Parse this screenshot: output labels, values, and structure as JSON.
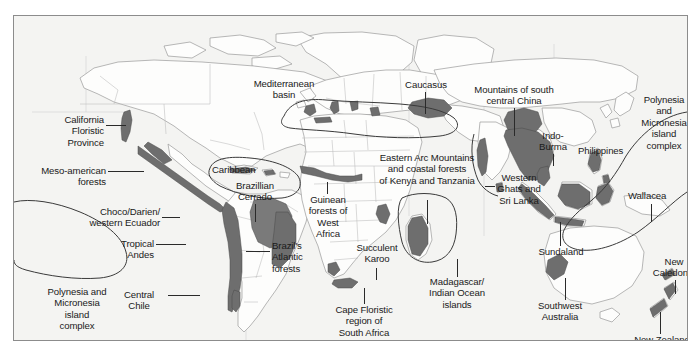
{
  "figure": {
    "type": "map",
    "frame": {
      "x": 13,
      "y": 15,
      "width": 675,
      "height": 326
    },
    "colors": {
      "background": "#ffffff",
      "map_background": "#f4f4f2",
      "frame_border": "#8c8c8c",
      "coastline": "#9a9a9a",
      "country_border": "#b4b4b4",
      "hotspot_fill": "#6e6e6e",
      "hotspot_outline": "#3a3a3a",
      "text": "#1a1a1a",
      "leader_line": "#2a2a2a"
    }
  },
  "labels": [
    {
      "id": "california-floristic-province",
      "text": "California\nFloristic\nProvince",
      "align": "right",
      "x": 18,
      "y": 98,
      "width": 72
    },
    {
      "id": "meso-american-forests",
      "text": "Meso-american\nforests",
      "align": "right",
      "x": 10,
      "y": 149,
      "width": 82
    },
    {
      "id": "choco-darien-western-ecuador",
      "text": "Choco/Darien/\nwestern Ecuador",
      "align": "right",
      "x": 58,
      "y": 190,
      "width": 88
    },
    {
      "id": "tropical-andes",
      "text": "Tropical\nAndes",
      "align": "right",
      "x": 78,
      "y": 222,
      "width": 62
    },
    {
      "id": "polynesia-micronesia-left",
      "text": "Polynesia and\nMicronesia\nisland\ncomplex",
      "align": "center",
      "x": 22,
      "y": 275,
      "width": 92
    },
    {
      "id": "central-chile",
      "text": "Central\nChile",
      "align": "center",
      "x": 98,
      "y": 273,
      "width": 54
    },
    {
      "id": "caribbean",
      "text": "Caribbean",
      "align": "left",
      "x": 198,
      "y": 148,
      "width": 62
    },
    {
      "id": "brazillian-cerrado",
      "text": "Brazillian\nCerrado",
      "align": "center",
      "x": 213,
      "y": 166,
      "width": 58
    },
    {
      "id": "brazils-atlantic-forests",
      "text": "Brazil's\nAtlantic\nforests",
      "align": "left",
      "x": 258,
      "y": 225,
      "width": 48
    },
    {
      "id": "mediterranean-basin",
      "text": "Mediterranean\nbasin",
      "align": "center",
      "x": 228,
      "y": 74,
      "width": 84
    },
    {
      "id": "caucasus",
      "text": "Caucasus",
      "align": "center",
      "x": 381,
      "y": 63,
      "width": 62
    },
    {
      "id": "mountains-south-central-china",
      "text": "Mountains of south\ncentral China",
      "align": "center",
      "x": 464,
      "y": 68,
      "width": 108
    },
    {
      "id": "indo-burma",
      "text": "Indo-\nBurma",
      "align": "center",
      "x": 522,
      "y": 115,
      "width": 38
    },
    {
      "id": "philippines",
      "text": "Philippines",
      "align": "left",
      "x": 567,
      "y": 130,
      "width": 64
    },
    {
      "id": "polynesia-micronesia-right",
      "text": "Polynesia\nand\nMicronesia\nisland\ncomplex",
      "align": "center",
      "x": 628,
      "y": 95,
      "width": 66
    },
    {
      "id": "eastern-arc-mountains",
      "text": "Eastern Arc Mountains\nand coastal forests\nof Kenya and Tanzania",
      "align": "center",
      "x": 348,
      "y": 148,
      "width": 132
    },
    {
      "id": "guinean-forests-west-africa",
      "text": "Guinean\nforests of\nWest\nAfrica",
      "align": "center",
      "x": 283,
      "y": 182,
      "width": 62
    },
    {
      "id": "succulent-karoo",
      "text": "Succulent\nKaroo",
      "align": "center",
      "x": 340,
      "y": 229,
      "width": 58
    },
    {
      "id": "cape-floristic-region",
      "text": "Cape Floristic\nregion of\nSouth Africa",
      "align": "center",
      "x": 308,
      "y": 295,
      "width": 84
    },
    {
      "id": "madagascar-indian-ocean",
      "text": "Madagascar/\nIndian Ocean\nislands",
      "align": "center",
      "x": 405,
      "y": 262,
      "width": 78
    },
    {
      "id": "western-ghats-sri-lanka",
      "text": "Western\nGhats and\nSri Lanka",
      "align": "center",
      "x": 479,
      "y": 157,
      "width": 58
    },
    {
      "id": "wallacea",
      "text": "Wallacea",
      "align": "left",
      "x": 621,
      "y": 190,
      "width": 58
    },
    {
      "id": "sundaland",
      "text": "Sundaland",
      "align": "center",
      "x": 521,
      "y": 230,
      "width": 62
    },
    {
      "id": "southwest-australia",
      "text": "Southwest\nAustralia",
      "align": "center",
      "x": 513,
      "y": 302,
      "width": 66
    },
    {
      "id": "new-caledonia",
      "text": "New\nCaledonia",
      "align": "center",
      "x": 637,
      "y": 251,
      "width": 58
    },
    {
      "id": "new-zealand",
      "text": "New Zealand",
      "align": "center",
      "x": 615,
      "y": 320,
      "width": 74
    }
  ],
  "leaders": [
    {
      "id": "leader-california",
      "type": "h",
      "x": 92,
      "y": 109,
      "length": 20
    },
    {
      "id": "leader-mesoamerican",
      "type": "h",
      "x": 94,
      "y": 155,
      "length": 36
    },
    {
      "id": "leader-choco",
      "type": "h",
      "x": 148,
      "y": 201,
      "length": 18
    },
    {
      "id": "leader-andes",
      "type": "h",
      "x": 142,
      "y": 228,
      "length": 30
    },
    {
      "id": "leader-chile",
      "type": "h",
      "x": 154,
      "y": 279,
      "length": 32
    },
    {
      "id": "leader-cerrado",
      "type": "v",
      "x": 241,
      "y": 188,
      "length": 18
    },
    {
      "id": "leader-atlantic",
      "type": "h",
      "x": 232,
      "y": 235,
      "length": 24
    },
    {
      "id": "leader-caucasus",
      "type": "v",
      "x": 411,
      "y": 76,
      "length": 22
    },
    {
      "id": "leader-china",
      "type": "v",
      "x": 500,
      "y": 92,
      "length": 28
    },
    {
      "id": "leader-indoburma",
      "type": "v",
      "x": 539,
      "y": 138,
      "length": 12
    },
    {
      "id": "leader-easternarc",
      "type": "v",
      "x": 413,
      "y": 184,
      "length": 24
    },
    {
      "id": "leader-guinean",
      "type": "v",
      "x": 313,
      "y": 173,
      "length": 10
    },
    {
      "id": "leader-karoo",
      "type": "v",
      "x": 362,
      "y": 254,
      "length": 12
    },
    {
      "id": "leader-cape",
      "type": "v",
      "x": 350,
      "y": 281,
      "length": 14
    },
    {
      "id": "leader-madagascar",
      "type": "v",
      "x": 443,
      "y": 243,
      "length": 18
    },
    {
      "id": "leader-ghats",
      "type": "h",
      "x": 471,
      "y": 170,
      "length": 10
    },
    {
      "id": "leader-wallacea",
      "type": "v",
      "x": 637,
      "y": 201,
      "length": 18
    },
    {
      "id": "leader-sundaland",
      "type": "v",
      "x": 546,
      "y": 206,
      "length": 24
    },
    {
      "id": "leader-southwest-aus",
      "type": "v",
      "x": 551,
      "y": 281,
      "length": 20
    },
    {
      "id": "leader-newcaledonia",
      "type": "v",
      "x": 661,
      "y": 273,
      "length": 14
    },
    {
      "id": "leader-newzealand",
      "type": "v",
      "x": 646,
      "y": 302,
      "length": 18
    }
  ],
  "hotspots": [
    "California Floristic Province",
    "Meso-american forests",
    "Caribbean",
    "Choco/Darien/western Ecuador",
    "Tropical Andes",
    "Central Chile",
    "Brazillian Cerrado",
    "Brazil's Atlantic forests",
    "Mediterranean basin",
    "Caucasus",
    "Guinean forests of West Africa",
    "Eastern Arc Mountains and coastal forests of Kenya and Tanzania",
    "Succulent Karoo",
    "Cape Floristic region of South Africa",
    "Madagascar/Indian Ocean islands",
    "Western Ghats and Sri Lanka",
    "Mountains of south central China",
    "Indo-Burma",
    "Philippines",
    "Sundaland",
    "Wallacea",
    "Polynesia and Micronesia island complex",
    "Southwest Australia",
    "New Caledonia",
    "New Zealand"
  ]
}
